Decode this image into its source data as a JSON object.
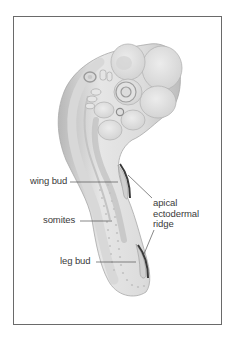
{
  "figure": {
    "labels": {
      "wing_bud": "wing bud",
      "somites": "somites",
      "leg_bud": "leg bud",
      "aer_line1": "apical",
      "aer_line2": "ectodermal",
      "aer_line3": "ridge"
    },
    "colors": {
      "frame": "#6a6a6a",
      "embryo_light": "#ebebeb",
      "embryo_mid": "#cfcfcf",
      "embryo_dark": "#9a9a9a",
      "ridge": "#3a3a3a",
      "leader_line": "#555555",
      "text": "#3a3a3a"
    }
  }
}
